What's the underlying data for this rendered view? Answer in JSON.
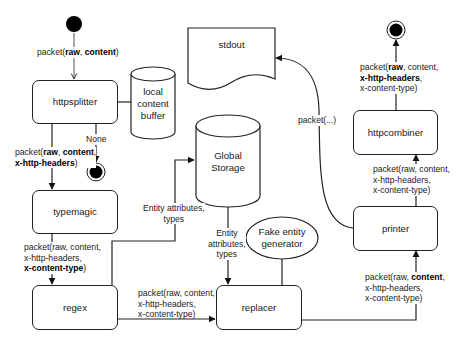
{
  "diagram": {
    "type": "flow",
    "nodes": {
      "start": {
        "kind": "start-node"
      },
      "httpsplitter": {
        "label": "httpsplitter"
      },
      "local_buffer": {
        "label_lines": [
          "local",
          "content",
          "buffer"
        ]
      },
      "end_none": {
        "kind": "end-node"
      },
      "typemagic": {
        "label": "typemagic"
      },
      "regex": {
        "label": "regex"
      },
      "global_storage": {
        "label_lines": [
          "Global",
          "Storage"
        ]
      },
      "replacer": {
        "label": "replacer"
      },
      "fake_gen": {
        "label_lines": [
          "Fake entity",
          "generator"
        ]
      },
      "stdout": {
        "label": "stdout"
      },
      "printer": {
        "label": "printer"
      },
      "httpcombiner": {
        "label": "httpcombiner"
      },
      "end_final": {
        "kind": "end-node"
      }
    },
    "edges": {
      "start_to_splitter": {
        "pre": "packet(",
        "b1": "raw",
        "mid": ", ",
        "b2": "content",
        "post": ")"
      },
      "splitter_none": {
        "label": "None"
      },
      "splitter_to_typemagic": {
        "l1_pre": "packet(",
        "l1_b1": "raw",
        "l1_mid": ", ",
        "l1_b2": "content",
        "l1_post": ",",
        "l2_b": "x-http-headers",
        "l2_post": ")"
      },
      "typemagic_to_regex": {
        "l1": "packet(raw, content,",
        "l2": "x-http-headers,",
        "l3_b": "x-content-type",
        "l3_post": ")"
      },
      "regex_to_storage": {
        "l1": "Entity attributes,",
        "l2": "types"
      },
      "storage_to_replacer": {
        "l1": "Entity",
        "l2": "attributes,",
        "l3": "types"
      },
      "regex_to_replacer": {
        "l1": "packet(raw, content,",
        "l2": "x-http-headers,",
        "l3": "x-content-type)"
      },
      "replacer_to_printer": {
        "l1_pre": "packet(raw, ",
        "l1_b": "content",
        "l1_post": ",",
        "l2": "x-http-headers,",
        "l3": "x-content-type)"
      },
      "printer_to_stdout": {
        "label": "packet(...)"
      },
      "printer_to_combiner": {
        "l1": "packet(raw, content,",
        "l2": "x-http-headers,",
        "l3": "x-content-type)"
      },
      "combiner_to_end": {
        "l1_pre": "packet(",
        "l1_b": "raw",
        "l1_post": ", content,",
        "l2_b": "x-http-headers",
        "l2_post": ",",
        "l3": "x-content-type)"
      }
    },
    "colors": {
      "stroke": "#222222",
      "fill": "#ffffff",
      "node_fill": "#000000"
    }
  }
}
